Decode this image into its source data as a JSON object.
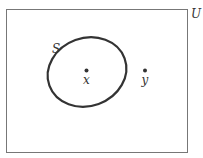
{
  "diagram": {
    "type": "venn",
    "universe_label": "U",
    "set_label": "S",
    "points": [
      {
        "label": "x",
        "inside_set": true
      },
      {
        "label": "y",
        "inside_set": false
      }
    ],
    "colors": {
      "stroke": "#333333",
      "background": "#ffffff"
    }
  }
}
